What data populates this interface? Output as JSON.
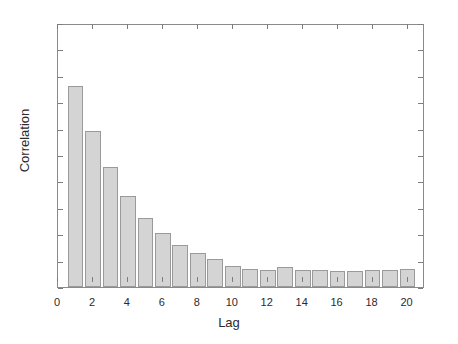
{
  "chart_data": {
    "type": "bar",
    "title": "",
    "xlabel": "Lag",
    "ylabel": "Correlation",
    "xlim": [
      0,
      21
    ],
    "ylim": [
      0,
      1
    ],
    "grid": false,
    "legend": null,
    "bar_color": "#d4d4d4",
    "bar_edge_color": "#9a9a9a",
    "axis_color": "#8a8a8a",
    "categories": [
      1,
      2,
      3,
      4,
      5,
      6,
      7,
      8,
      9,
      10,
      11,
      12,
      13,
      14,
      15,
      16,
      17,
      18,
      19,
      20
    ],
    "values": [
      0.76,
      0.59,
      0.455,
      0.345,
      0.26,
      0.205,
      0.16,
      0.13,
      0.105,
      0.08,
      0.07,
      0.065,
      0.075,
      0.065,
      0.065,
      0.06,
      0.06,
      0.065,
      0.065,
      0.07
    ],
    "xticks": [
      0,
      2,
      4,
      6,
      8,
      10,
      12,
      14,
      16,
      18,
      20
    ],
    "xtick_labels": [
      "0",
      "2",
      "4",
      "6",
      "8",
      "10",
      "12",
      "14",
      "16",
      "18",
      "20"
    ],
    "yticks": [
      0,
      0.1,
      0.2,
      0.3,
      0.4,
      0.5,
      0.6,
      0.7,
      0.8,
      0.9,
      1
    ],
    "ytick_labels": [
      "0",
      "0.1",
      "0.2",
      "0.3",
      "0.4",
      "0.5",
      "0.6",
      "0.7",
      "0.8",
      "0.9",
      "1"
    ]
  }
}
